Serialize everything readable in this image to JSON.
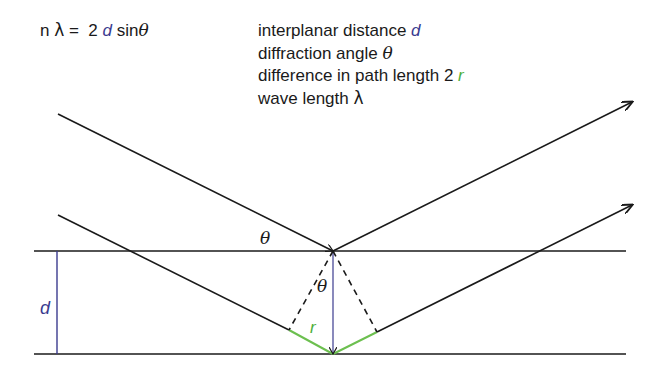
{
  "formula": {
    "n": "n",
    "lambda": "λ",
    "equals": " =  2 ",
    "d": "d",
    "sin": " sin",
    "theta": "θ"
  },
  "legend": {
    "items": [
      {
        "text": "interplanar distance ",
        "symbol": "d",
        "symbol_color": "#3b3b8f"
      },
      {
        "text": "diffraction angle ",
        "symbol": "θ",
        "symbol_color": "#1a1a1a"
      },
      {
        "text": "difference in path length 2 ",
        "symbol": "r",
        "symbol_color": "#4caf3a"
      },
      {
        "text": "wave length ",
        "symbol": "λ",
        "symbol_color": "#1a1a1a"
      }
    ]
  },
  "diagram": {
    "labels": {
      "theta_top": "θ",
      "theta_inner": "θ",
      "d": "d",
      "r": "r"
    },
    "colors": {
      "line": "#1a1a1a",
      "d_marker": "#3b3b8f",
      "path_difference": "#6cbf4f"
    }
  }
}
